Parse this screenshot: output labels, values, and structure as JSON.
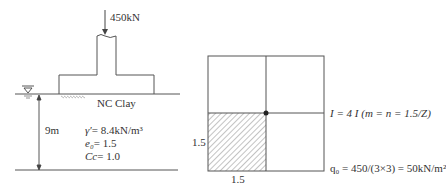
{
  "left_figure": {
    "load_label": "450kN",
    "soil_label": "NC Clay",
    "depth_label": "9m",
    "properties": [
      {
        "symbol": "γ′",
        "value": "= 8.4kN/m³"
      },
      {
        "symbol": "e₀",
        "value": "= 1.5"
      },
      {
        "symbol": "Cc",
        "value": "= 1.0"
      }
    ],
    "water_table_icon": "▽"
  },
  "right_figure": {
    "dim_vertical": "1.5",
    "dim_horizontal": "1.5",
    "influence_eq": "I = 4 I (m = n = 1.5/Z)",
    "pressure_eq": "q₀ = 450/(3×3) = 50kN/m²"
  },
  "colors": {
    "line": "#555555",
    "hatch": "#777777",
    "text": "#333333"
  }
}
